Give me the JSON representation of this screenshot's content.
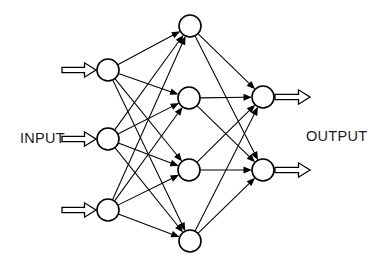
{
  "diagram": {
    "type": "neural-network-diagram",
    "background_color": "#ffffff",
    "stroke_color": "#000000",
    "node_fill_color": "#ffffff",
    "width": 385,
    "height": 263,
    "labels": {
      "input": "INPUT",
      "output": "OUTPUT"
    },
    "label_positions": {
      "input": {
        "x": 20,
        "y": 143
      },
      "output": {
        "x": 306,
        "y": 141
      }
    },
    "node_radius": 11,
    "layers": [
      {
        "name": "input-layer",
        "role": "input",
        "node_count": 3,
        "nodes": [
          {
            "id": "i1",
            "cx": 108,
            "cy": 70
          },
          {
            "id": "i2",
            "cx": 108,
            "cy": 139
          },
          {
            "id": "i3",
            "cx": 108,
            "cy": 210
          }
        ]
      },
      {
        "name": "hidden-layer",
        "role": "hidden",
        "node_count": 4,
        "nodes": [
          {
            "id": "h1",
            "cx": 190,
            "cy": 26
          },
          {
            "id": "h2",
            "cx": 189,
            "cy": 98
          },
          {
            "id": "h3",
            "cx": 189,
            "cy": 170
          },
          {
            "id": "h4",
            "cx": 190,
            "cy": 241
          }
        ]
      },
      {
        "name": "output-layer",
        "role": "output",
        "node_count": 2,
        "nodes": [
          {
            "id": "o1",
            "cx": 263,
            "cy": 97
          },
          {
            "id": "o2",
            "cx": 263,
            "cy": 170
          }
        ]
      }
    ],
    "connections": {
      "input_to_hidden": [
        [
          "i1",
          "h1"
        ],
        [
          "i1",
          "h2"
        ],
        [
          "i1",
          "h3"
        ],
        [
          "i1",
          "h4"
        ],
        [
          "i2",
          "h1"
        ],
        [
          "i2",
          "h2"
        ],
        [
          "i2",
          "h3"
        ],
        [
          "i2",
          "h4"
        ],
        [
          "i3",
          "h1"
        ],
        [
          "i3",
          "h2"
        ],
        [
          "i3",
          "h3"
        ],
        [
          "i3",
          "h4"
        ]
      ],
      "hidden_to_output": [
        [
          "h1",
          "o1"
        ],
        [
          "h1",
          "o2"
        ],
        [
          "h2",
          "o1"
        ],
        [
          "h2",
          "o2"
        ],
        [
          "h3",
          "o1"
        ],
        [
          "h3",
          "o2"
        ],
        [
          "h4",
          "o1"
        ],
        [
          "h4",
          "o2"
        ]
      ],
      "fully_connected": true
    },
    "input_arrows": [
      {
        "id": "in-arrow-1",
        "x_start": 62,
        "x_end": 96,
        "y": 70
      },
      {
        "id": "in-arrow-2",
        "x_start": 62,
        "x_end": 96,
        "y": 139
      },
      {
        "id": "in-arrow-3",
        "x_start": 62,
        "x_end": 96,
        "y": 210
      }
    ],
    "output_arrows": [
      {
        "id": "out-arrow-1",
        "x_start": 275,
        "x_end": 310,
        "y": 97
      },
      {
        "id": "out-arrow-2",
        "x_start": 275,
        "x_end": 310,
        "y": 170
      }
    ]
  }
}
